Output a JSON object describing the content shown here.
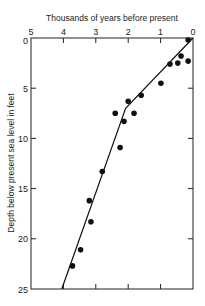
{
  "chart_data": {
    "type": "scatter",
    "title": "",
    "xlabel": "Thousands of years before present",
    "ylabel": "Depth below present sea level in feet",
    "x_axis_position": "top",
    "x_reversed": true,
    "y_reversed": true,
    "xlim": [
      5,
      0
    ],
    "ylim": [
      0,
      25
    ],
    "x_ticks": [
      5,
      4,
      3,
      2,
      1,
      0
    ],
    "y_ticks": [
      0,
      5,
      10,
      15,
      20,
      25
    ],
    "grid": false,
    "legend": null,
    "series": [
      {
        "name": "Samples",
        "kind": "scatter",
        "points": [
          {
            "x": 0.15,
            "y": 0.2
          },
          {
            "x": 0.37,
            "y": 1.8
          },
          {
            "x": 0.47,
            "y": 2.5
          },
          {
            "x": 0.15,
            "y": 2.3
          },
          {
            "x": 0.71,
            "y": 2.6
          },
          {
            "x": 0.99,
            "y": 4.5
          },
          {
            "x": 1.6,
            "y": 5.7
          },
          {
            "x": 2.0,
            "y": 6.3
          },
          {
            "x": 1.82,
            "y": 7.5
          },
          {
            "x": 2.4,
            "y": 7.5
          },
          {
            "x": 2.13,
            "y": 8.3
          },
          {
            "x": 2.25,
            "y": 10.9
          },
          {
            "x": 2.8,
            "y": 13.3
          },
          {
            "x": 3.2,
            "y": 16.2
          },
          {
            "x": 3.15,
            "y": 18.3
          },
          {
            "x": 3.47,
            "y": 21.1
          },
          {
            "x": 3.72,
            "y": 22.7
          }
        ]
      },
      {
        "name": "Sea-level curve",
        "kind": "line",
        "points": [
          {
            "x": 4.05,
            "y": 25
          },
          {
            "x": 2.08,
            "y": 7.0
          },
          {
            "x": 0.0,
            "y": 0.0
          }
        ]
      }
    ]
  }
}
